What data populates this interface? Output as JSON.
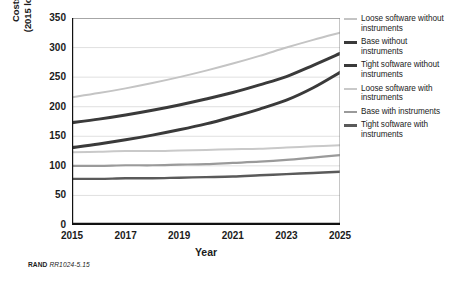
{
  "footer": {
    "org": "RAND",
    "figure_id": "RR1024-5.15"
  },
  "legend": {
    "items": [
      {
        "label": "Loose software without instruments",
        "color": "#c4c4c4",
        "width": 2.0
      },
      {
        "label": "Base without instruments",
        "color": "#3a3a3a",
        "width": 3.0
      },
      {
        "label": "Tight software without instruments",
        "color": "#3a3a3a",
        "width": 3.0
      },
      {
        "label": "Loose software with instruments",
        "color": "#c9c9c9",
        "width": 2.0
      },
      {
        "label": "Base with instruments",
        "color": "#9a9a9a",
        "width": 2.2
      },
      {
        "label": "Tight software with instruments",
        "color": "#5a5a5a",
        "width": 2.4
      }
    ]
  },
  "chart_data": {
    "type": "line",
    "title": "",
    "xlabel": "Year",
    "ylabel": "Costs over time, by percentage (2015 losses to cyberattack = 100%)",
    "ylabel_lines": [
      "Costs over time, by percentage",
      "(2015 losses to cyberattack = 100%)"
    ],
    "x": [
      2015,
      2016,
      2017,
      2018,
      2019,
      2020,
      2021,
      2022,
      2023,
      2024,
      2025
    ],
    "xlim": [
      2015,
      2025
    ],
    "ylim": [
      0,
      350
    ],
    "xticks": [
      2015,
      2016,
      2017,
      2018,
      2019,
      2020,
      2021,
      2022,
      2023,
      2024,
      2025
    ],
    "xtick_labels": [
      "2015",
      "",
      "2017",
      "",
      "2019",
      "",
      "2021",
      "",
      "2023",
      "",
      "2025"
    ],
    "yticks": [
      0,
      50,
      100,
      150,
      200,
      250,
      300,
      350
    ],
    "ytick_labels": [
      "0",
      "50",
      "100",
      "150",
      "200",
      "250",
      "300",
      "350"
    ],
    "grid": true,
    "grid_axis": "y",
    "legend_position": "right",
    "series": [
      {
        "name": "Loose software without instruments",
        "color": "#c4c4c4",
        "width": 2.0,
        "values": [
          216,
          223,
          231,
          240,
          250,
          261,
          273,
          286,
          300,
          313,
          325
        ]
      },
      {
        "name": "Base without instruments",
        "color": "#3a3a3a",
        "width": 3.0,
        "values": [
          173,
          179,
          186,
          194,
          203,
          213,
          224,
          237,
          251,
          270,
          290
        ]
      },
      {
        "name": "Tight software without instruments",
        "color": "#3a3a3a",
        "width": 3.0,
        "values": [
          131,
          137,
          144,
          152,
          161,
          171,
          183,
          196,
          211,
          232,
          258
        ]
      },
      {
        "name": "Loose software with instruments",
        "color": "#c9c9c9",
        "width": 2.0,
        "values": [
          123,
          124,
          125,
          125,
          126,
          127,
          128,
          129,
          131,
          133,
          135
        ]
      },
      {
        "name": "Base with instruments",
        "color": "#9a9a9a",
        "width": 2.2,
        "values": [
          100,
          100,
          101,
          101,
          102,
          103,
          105,
          107,
          110,
          114,
          118
        ]
      },
      {
        "name": "Tight software with instruments",
        "color": "#5a5a5a",
        "width": 2.4,
        "values": [
          78,
          78,
          79,
          79,
          80,
          81,
          82,
          84,
          86,
          88,
          90
        ]
      }
    ]
  }
}
